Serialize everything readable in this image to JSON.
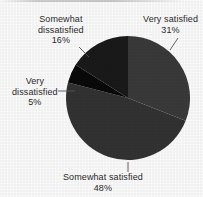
{
  "chart_data": {
    "type": "pie",
    "title": "",
    "subtitle": "",
    "xlabel": "",
    "ylabel": "",
    "legend_position": "none",
    "grid": false,
    "labels_outside": true,
    "categories": [
      "Very satisfied",
      "Somewhat satisfied",
      "Very dissatisfied",
      "Somewhat dissatisfied"
    ],
    "values": [
      31,
      48,
      5,
      16
    ],
    "value_unit": "%",
    "start_angle_deg": 0,
    "direction": "clockwise",
    "slices": [
      {
        "label": "Very satisfied",
        "value": 31,
        "value_text": "31%",
        "color": "#3a3a3a",
        "start_deg": 0,
        "end_deg": 111.6
      },
      {
        "label": "Somewhat satisfied",
        "value": 48,
        "value_text": "48%",
        "color": "#333333",
        "start_deg": 111.6,
        "end_deg": 284.4
      },
      {
        "label": "Very dissatisfied",
        "value": 5,
        "value_text": "5%",
        "color": "#0a0a0a",
        "start_deg": 284.4,
        "end_deg": 302.4
      },
      {
        "label": "Somewhat dissatisfied",
        "value": 16,
        "value_text": "16%",
        "color": "#1a1a1a",
        "start_deg": 302.4,
        "end_deg": 360
      }
    ]
  },
  "labels": {
    "very_satisfied": {
      "name": "Very satisfied",
      "percent": "31%"
    },
    "somewhat_dissatisfied": {
      "name_line1": "Somewhat",
      "name_line2": "dissatisfied",
      "percent": "16%"
    },
    "very_dissatisfied": {
      "name_line1": "Very",
      "name_line2": "dissatisfied",
      "percent": "5%"
    },
    "somewhat_satisfied": {
      "name": "Somewhat satisfied",
      "percent": "48%"
    }
  },
  "style": {
    "background": "#fdfdfd",
    "text_color": "#2b2b2b",
    "leader_line_color": "#555555"
  }
}
